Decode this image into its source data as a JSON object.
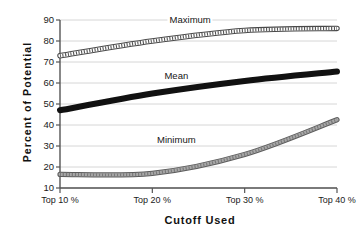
{
  "chart_data": {
    "type": "line",
    "title": "",
    "xlabel": "Cutoff  Used",
    "ylabel": "Percent  of  Potential",
    "x": [
      "Top 10 %",
      "Top 20 %",
      "Top 30 %",
      "Top 40 %"
    ],
    "categories": [
      "Top 10 %",
      "Top 20 %",
      "Top 30 %",
      "Top 40 %"
    ],
    "xtick_labels": [
      "Top 10 %",
      "Top 20 %",
      "Top 30 %",
      "Top 40 %"
    ],
    "ytick_labels": [
      "10",
      "20",
      "30",
      "40",
      "50",
      "60",
      "70",
      "80",
      "90"
    ],
    "ytick_values": [
      10,
      20,
      30,
      40,
      50,
      60,
      70,
      80,
      90
    ],
    "ylim": [
      10,
      90
    ],
    "grid": "horizontal",
    "legend_position": "inline-annotations",
    "series": [
      {
        "name": "Maximum",
        "values": [
          73,
          80,
          85,
          86
        ],
        "style": "stippled-band",
        "color": "#888888",
        "label_x_category_fraction": 0.47,
        "label_value": 90
      },
      {
        "name": "Mean",
        "values": [
          47,
          55,
          61,
          65.5
        ],
        "style": "solid-thick-band",
        "color": "#111111",
        "label_x_category_fraction": 0.42,
        "label_value": 63.5
      },
      {
        "name": "Minimum",
        "values": [
          16.5,
          17,
          26,
          42.5
        ],
        "style": "gray-band",
        "color": "#808080",
        "label_x_category_fraction": 0.42,
        "label_value": 33
      }
    ],
    "annotations": [
      {
        "text": "Maximum",
        "series": "Maximum"
      },
      {
        "text": "Mean",
        "series": "Mean"
      },
      {
        "text": "Minimum",
        "series": "Minimum"
      }
    ]
  },
  "axes": {
    "y_title": "Percent  of  Potential",
    "x_title": "Cutoff  Used",
    "axis_color": "#555555",
    "grid_color": "#cccccc"
  }
}
